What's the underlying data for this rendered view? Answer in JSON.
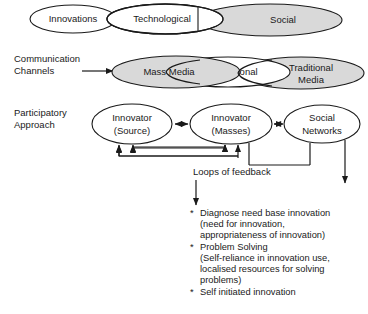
{
  "diagram": {
    "colors": {
      "shaded_fill": "#d9d9d9",
      "plain_fill": "#ffffff",
      "stroke": "#1a1a1a",
      "background": "#ffffff"
    },
    "rows": [
      {
        "id": "innovations-row",
        "label": "Innovations",
        "row_caption": "",
        "nodes": [
          {
            "id": "innovations",
            "label": "Innovations",
            "fill": "plain"
          },
          {
            "id": "technological",
            "label": "Technological",
            "fill": "plain"
          },
          {
            "id": "social",
            "label": "Social",
            "fill": "shaded"
          }
        ]
      },
      {
        "id": "communication-row",
        "row_caption_line1": "Communication",
        "row_caption_line2": "Channels",
        "nodes": [
          {
            "id": "mass-media",
            "label": "Mass Media",
            "fill": "shaded"
          },
          {
            "id": "inter-personal",
            "label": "Inter Personal",
            "fill": "plain"
          },
          {
            "id": "traditional-media",
            "label_line1": "Traditional",
            "label_line2": "Media",
            "fill": "shaded"
          }
        ]
      },
      {
        "id": "participatory-row",
        "row_caption_line1": "Participatory",
        "row_caption_line2": "Approach",
        "nodes": [
          {
            "id": "innovator-source",
            "label_line1": "Innovator",
            "label_line2": "(Source)",
            "fill": "plain"
          },
          {
            "id": "innovator-masses",
            "label_line1": "Innovator",
            "label_line2": "(Masses)",
            "fill": "plain"
          },
          {
            "id": "social-networks",
            "label_line1": "Social",
            "label_line2": "Networks",
            "fill": "plain"
          }
        ]
      }
    ],
    "loops_label": "Loops of feedback",
    "outcomes": [
      {
        "bullet": "*",
        "lines": [
          "Diagnose need base innovation",
          "(need for innovation,",
          "appropriateness of innovation)"
        ]
      },
      {
        "bullet": "*",
        "lines": [
          "Problem Solving",
          "(Self-reliance in innovation use,",
          "localised resources for solving",
          "problems)"
        ]
      },
      {
        "bullet": "*",
        "lines": [
          "Self initiated innovation"
        ]
      }
    ]
  }
}
